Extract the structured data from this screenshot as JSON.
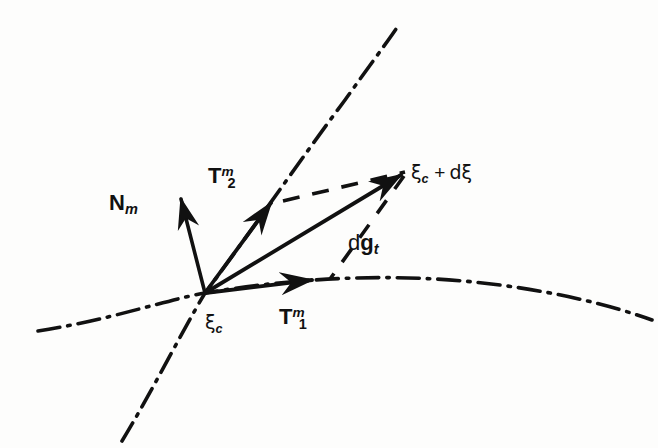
{
  "figure": {
    "background_color": "#fdfdfc",
    "ink_color": "#111111",
    "width": 658,
    "height": 448
  },
  "labels": {
    "normal_vector": {
      "symbol": "N",
      "subscript": "m",
      "text": "N_m"
    },
    "tangent_2": {
      "symbol": "T",
      "subscript": "2",
      "superscript": "m",
      "text": "T_2^m"
    },
    "tangent_1": {
      "symbol": "T",
      "subscript": "1",
      "superscript": "m",
      "text": "T_1^m"
    },
    "increment_vector": {
      "prefix": "d",
      "symbol": "g",
      "subscript": "t",
      "text": "dg_t"
    },
    "contact_point": {
      "symbol": "ξ",
      "subscript": "c",
      "text": "ξ_c"
    },
    "contact_point_incremented": {
      "text": "ξ_c + dξ",
      "symbol": "ξ",
      "subscript": "c",
      "operator": "+",
      "delta": "dξ"
    }
  },
  "arrows": [
    {
      "name": "normal-vector-arrow",
      "from": [
        205,
        293
      ],
      "to": [
        180,
        196
      ],
      "label": "N_m"
    },
    {
      "name": "tangent-2-arrow",
      "from": [
        205,
        293
      ],
      "to": [
        273,
        200
      ],
      "label": "T_2^m"
    },
    {
      "name": "tangent-1-arrow",
      "from": [
        205,
        293
      ],
      "to": [
        317,
        279
      ],
      "label": "T_1^m"
    },
    {
      "name": "increment-arrow",
      "from": [
        205,
        293
      ],
      "to": [
        406,
        172
      ],
      "label": "dg_t"
    }
  ],
  "curves": [
    {
      "name": "coordinate-line-horizontal",
      "style": "dash-dot",
      "description": "surface coordinate line passing through contact point, sweeping right and slightly down"
    },
    {
      "name": "coordinate-line-diagonal",
      "style": "dash-dot",
      "description": "surface coordinate line rising to upper right and descending to lower left"
    }
  ],
  "dashed_guides": [
    {
      "name": "guide-horizontal-upper",
      "style": "dashed",
      "description": "dashed construction line from tangent-2 direction to incremented point"
    },
    {
      "name": "guide-diagonal-lower",
      "style": "dashed",
      "description": "dashed construction line from tangent-1 direction to incremented point"
    }
  ]
}
